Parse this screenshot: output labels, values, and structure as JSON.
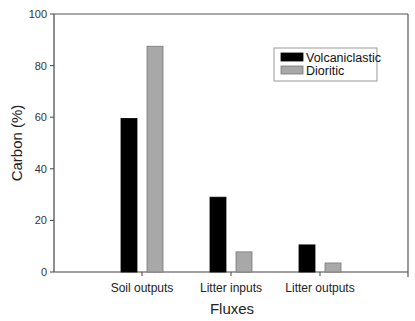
{
  "chart_data": {
    "type": "bar",
    "title": "",
    "xlabel": "Fluxes",
    "ylabel": "Carbon (%)",
    "ylim": [
      0,
      100
    ],
    "yticks": [
      0,
      20,
      40,
      60,
      80,
      100
    ],
    "categories": [
      "Soil outputs",
      "Litter inputs",
      "Litter outputs"
    ],
    "series": [
      {
        "name": "Volcaniclastic",
        "color": "#000000",
        "values": [
          59.5,
          29,
          10.5
        ]
      },
      {
        "name": "Dioritic",
        "color": "#a8a8a8",
        "values": [
          87.5,
          7.8,
          3.5
        ]
      }
    ],
    "legend_position": "upper right",
    "grid": false
  }
}
